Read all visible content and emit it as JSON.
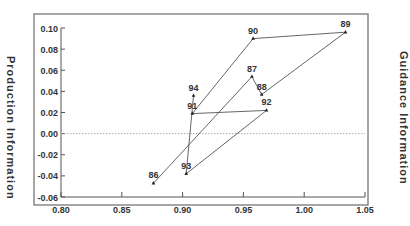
{
  "chart_data": {
    "type": "line",
    "title": "",
    "xlabel": "",
    "ylabel": "Production Information",
    "ylabel_right": "Guidance Information",
    "xlim": [
      0.8,
      1.05
    ],
    "ylim": [
      -0.06,
      0.1
    ],
    "x_ticks": [
      "0.80",
      "0.85",
      "0.90",
      "0.95",
      "1.00",
      "1.05"
    ],
    "y_ticks": [
      "0.10",
      "0.08",
      "0.06",
      "0.04",
      "0.02",
      "0.00",
      "-0.02",
      "-0.04",
      "-0.06"
    ],
    "grid": false,
    "reference_line": {
      "y": 0.0,
      "style": "dotted"
    },
    "legend": null,
    "series": [
      {
        "name": "year path",
        "points": [
          {
            "label": "86",
            "x": 0.876,
            "y": -0.047
          },
          {
            "label": "87",
            "x": 0.957,
            "y": 0.054
          },
          {
            "label": "88",
            "x": 0.965,
            "y": 0.037
          },
          {
            "label": "89",
            "x": 1.034,
            "y": 0.096
          },
          {
            "label": "90",
            "x": 0.958,
            "y": 0.09
          },
          {
            "label": "91",
            "x": 0.908,
            "y": 0.019
          },
          {
            "label": "92",
            "x": 0.969,
            "y": 0.022
          },
          {
            "label": "93",
            "x": 0.903,
            "y": -0.038
          },
          {
            "label": "94",
            "x": 0.909,
            "y": 0.036
          }
        ]
      }
    ]
  },
  "labels": {
    "left": "Production Information",
    "right": "Guidance Information"
  },
  "colors": {
    "line": "#555555",
    "axis": "#555555",
    "frame": "#666666",
    "refline": "#aaaaaa",
    "text": "#333333"
  }
}
